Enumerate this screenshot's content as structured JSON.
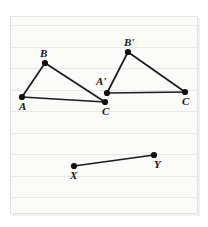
{
  "figure": {
    "background": {
      "paper_color": "#fbfbfa",
      "rule_line_color": "#e8e8e6",
      "rule_line_count": 9,
      "rule_line_spacing": 21.5,
      "rule_line_first_y": 24
    },
    "ink_color": "#1a1a1a",
    "points": [
      {
        "id": "A",
        "label": "A",
        "x": 22,
        "y": 97,
        "label_x": 19,
        "label_y": 101
      },
      {
        "id": "B",
        "label": "B",
        "x": 45,
        "y": 63,
        "label_x": 40,
        "label_y": 48
      },
      {
        "id": "C",
        "label": "C",
        "x": 105,
        "y": 102,
        "label_x": 102,
        "label_y": 106
      },
      {
        "id": "Aprime",
        "label": "A'",
        "x": 107,
        "y": 93,
        "label_x": 96,
        "label_y": 76
      },
      {
        "id": "Bprime",
        "label": "B'",
        "x": 128,
        "y": 52,
        "label_x": 124,
        "label_y": 37
      },
      {
        "id": "Cprime",
        "label": "C",
        "x": 185,
        "y": 92,
        "label_x": 182,
        "label_y": 96
      },
      {
        "id": "X",
        "label": "X",
        "x": 74,
        "y": 166,
        "label_x": 70,
        "label_y": 170
      },
      {
        "id": "Y",
        "label": "Y",
        "x": 154,
        "y": 155,
        "label_x": 154,
        "label_y": 159
      }
    ],
    "segments": [
      {
        "name": "A-B",
        "from": "A",
        "to": "B"
      },
      {
        "name": "B-C",
        "from": "B",
        "to": "C"
      },
      {
        "name": "A-C",
        "from": "A",
        "to": "C"
      },
      {
        "name": "A'-B'",
        "from": "Aprime",
        "to": "Bprime"
      },
      {
        "name": "B'-C'",
        "from": "Bprime",
        "to": "Cprime"
      },
      {
        "name": "A'-C'",
        "from": "Aprime",
        "to": "Cprime"
      },
      {
        "name": "X-Y",
        "from": "X",
        "to": "Y"
      }
    ],
    "dot_radius": 3.1
  }
}
